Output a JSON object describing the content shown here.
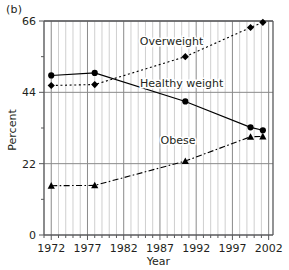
{
  "panel": {
    "label": "(b)"
  },
  "chart_data": {
    "type": "line",
    "title": "",
    "subtitle": "",
    "xlabel": "Year",
    "ylabel": "Percent",
    "xlim": [
      1971,
      2002.6
    ],
    "ylim": [
      0,
      66
    ],
    "xticks": [
      1972,
      1977,
      1982,
      1987,
      1992,
      1997,
      2002
    ],
    "xticklabels": [
      "1972",
      "1977",
      "1982",
      "1987",
      "1992",
      "1997",
      "2002"
    ],
    "yticks": [
      0,
      22,
      44,
      66
    ],
    "yticklabels": [
      "0",
      "22",
      "44",
      "66"
    ],
    "minor_xtick_step": 1,
    "grid": "vertical-minor-and-major plus horizontal major",
    "legend": "inline-annotations",
    "series": [
      {
        "name": "Overweight",
        "label": "Overweight",
        "marker": "diamond",
        "line": "dotted",
        "color": "#000000",
        "label_x": 1988.6,
        "label_y": 58.5,
        "points": [
          {
            "x": 1972,
            "y": 46.1
          },
          {
            "x": 1978,
            "y": 46.4
          },
          {
            "x": 1990.5,
            "y": 55.0
          },
          {
            "x": 1999.5,
            "y": 64.0
          },
          {
            "x": 2001.2,
            "y": 65.6
          }
        ]
      },
      {
        "name": "Healthy weight",
        "label": "Healthy weight",
        "marker": "circle",
        "line": "solid",
        "color": "#000000",
        "label_x": 1990.0,
        "label_y": 45.6,
        "points": [
          {
            "x": 1972,
            "y": 49.2
          },
          {
            "x": 1978,
            "y": 50.0
          },
          {
            "x": 1990.5,
            "y": 41.2
          },
          {
            "x": 1999.5,
            "y": 33.2
          },
          {
            "x": 2001.2,
            "y": 32.3
          }
        ]
      },
      {
        "name": "Obese",
        "label": "Obese",
        "marker": "triangle",
        "line": "dash-dot",
        "color": "#000000",
        "label_x": 1989.5,
        "label_y": 28.0,
        "points": [
          {
            "x": 1972,
            "y": 15.2
          },
          {
            "x": 1978,
            "y": 15.3
          },
          {
            "x": 1990.5,
            "y": 22.8
          },
          {
            "x": 1999.5,
            "y": 30.3
          },
          {
            "x": 2001.2,
            "y": 30.4
          }
        ]
      }
    ]
  }
}
